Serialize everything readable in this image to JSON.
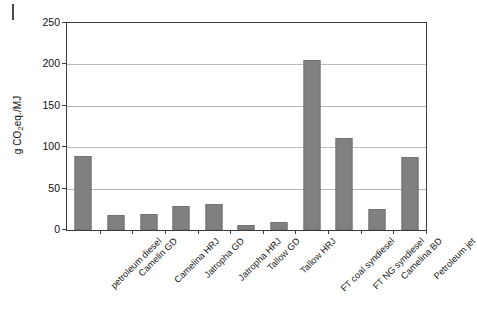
{
  "chart_data": {
    "type": "bar",
    "title": "",
    "xlabel": "",
    "ylabel": "g CO2eq./MJ",
    "ylabel_parts": {
      "pre": "g CO",
      "sub": "2",
      "post": "eq./MJ"
    },
    "ylim": [
      0,
      250
    ],
    "yticks": [
      0,
      50,
      100,
      150,
      200,
      250
    ],
    "ytick_labels": [
      "0",
      "50",
      "100",
      "150",
      "200",
      "250"
    ],
    "grid": "horizontal",
    "legend": "none",
    "bar_color": "#808080",
    "categories": [
      "petroleum diesel",
      "Camelin GD",
      "Camelina HRJ",
      "Jatropha GD",
      "Jatropha HRJ",
      "Tallow GD",
      "Tallow HRJ",
      "FT coal syndiesel",
      "FT NG syndiesel",
      "Camelina BD",
      "Petroleum jet"
    ],
    "values": [
      89,
      18,
      19,
      29,
      32,
      6,
      10,
      205,
      111,
      25,
      88
    ]
  }
}
